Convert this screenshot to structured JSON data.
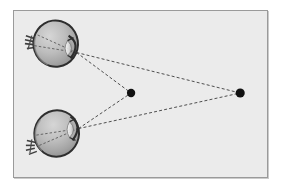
{
  "figure": {
    "type": "diagram",
    "canvas": {
      "width": 282,
      "height": 196
    },
    "frame": {
      "x": 13,
      "y": 10,
      "width": 255,
      "height": 168,
      "background_color": "#ebebeb",
      "border_color": "#9a9a9a",
      "page_background_color": "#ffffff"
    },
    "colors": {
      "sclera_outline": "#2b2b2b",
      "eye_fill_light": "#c9c9c9",
      "eye_fill_mid": "#b0b0b0",
      "eye_fill_dark": "#8f8f8f",
      "lens_fill": "#e3e3e3",
      "sight_line": "#3a3a3a",
      "fixation_point": "#111111",
      "optic_nerve": "#4a4a4a"
    },
    "eyes": [
      {
        "id": "upper-eye",
        "label": "Upper eye",
        "center": {
          "x": 55,
          "y": 43
        },
        "radius_x": 23,
        "radius_y": 24,
        "rotation_deg": -8,
        "nodal_point": {
          "x": 76,
          "y": 52
        },
        "optic_nerve": {
          "x": 28,
          "y": 41,
          "length": 9,
          "angle_deg": 8
        }
      },
      {
        "id": "lower-eye",
        "label": "Lower eye",
        "center": {
          "x": 56,
          "y": 134
        },
        "radius_x": 23,
        "radius_y": 24,
        "rotation_deg": 12,
        "nodal_point": {
          "x": 78,
          "y": 129
        },
        "optic_nerve": {
          "x": 29,
          "y": 146,
          "length": 9,
          "angle_deg": -8
        }
      }
    ],
    "fixation_points": [
      {
        "id": "near-point",
        "label": "Near fixation point",
        "x": 131,
        "y": 93,
        "radius": 4.2
      },
      {
        "id": "far-point",
        "label": "Far fixation point",
        "x": 241,
        "y": 93,
        "radius": 4.6
      }
    ],
    "sight_lines": [
      {
        "id": "upper-eye-to-near-point",
        "from": "upper-eye",
        "to": "near-point",
        "x1": 76,
        "y1": 52,
        "x2": 131,
        "y2": 93,
        "style": "dashed"
      },
      {
        "id": "upper-eye-to-far-point",
        "from": "upper-eye",
        "to": "far-point",
        "x1": 76,
        "y1": 52,
        "x2": 241,
        "y2": 93,
        "style": "dashed"
      },
      {
        "id": "lower-eye-to-near-point",
        "from": "lower-eye",
        "to": "near-point",
        "x1": 78,
        "y1": 129,
        "x2": 131,
        "y2": 93,
        "style": "dashed"
      },
      {
        "id": "lower-eye-to-far-point",
        "from": "lower-eye",
        "to": "far-point",
        "x1": 78,
        "y1": 129,
        "x2": 241,
        "y2": 93,
        "style": "dashed"
      }
    ],
    "internal_rays": [
      {
        "id": "upper-eye-internal-ray-1",
        "eye": "upper-eye",
        "x1": 76,
        "y1": 52,
        "x2": 34,
        "y2": 33
      },
      {
        "id": "upper-eye-internal-ray-2",
        "eye": "upper-eye",
        "x1": 76,
        "y1": 52,
        "x2": 33,
        "y2": 45
      },
      {
        "id": "lower-eye-internal-ray-1",
        "eye": "lower-eye",
        "x1": 78,
        "y1": 129,
        "x2": 34,
        "y2": 148
      },
      {
        "id": "lower-eye-internal-ray-2",
        "eye": "lower-eye",
        "x1": 78,
        "y1": 129,
        "x2": 33,
        "y2": 136
      }
    ]
  }
}
